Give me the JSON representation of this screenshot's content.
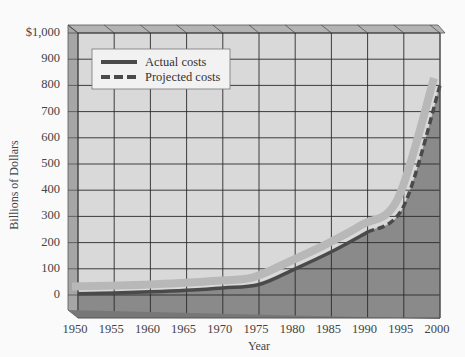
{
  "chart_data": {
    "type": "area",
    "title": "",
    "xlabel": "Year",
    "ylabel": "Billions of Dollars",
    "x": [
      1950,
      1955,
      1960,
      1965,
      1970,
      1975,
      1980,
      1985,
      1990,
      1995,
      2000
    ],
    "xticks": [
      "1950",
      "1955",
      "1960",
      "1965",
      "1970",
      "1975",
      "1980",
      "1985",
      "1990",
      "1995",
      "2000"
    ],
    "yticks": [
      "0",
      "100",
      "200",
      "300",
      "400",
      "500",
      "600",
      "700",
      "800",
      "900",
      "$1,000"
    ],
    "ylim": [
      0,
      1000
    ],
    "grid": true,
    "legend_position": "upper-left",
    "series": [
      {
        "name": "Actual costs",
        "style": "solid",
        "x": [
          1950,
          1955,
          1960,
          1965,
          1970,
          1975,
          1980,
          1985,
          1990
        ],
        "values": [
          5,
          8,
          12,
          18,
          27,
          40,
          100,
          165,
          240
        ]
      },
      {
        "name": "Projected costs",
        "style": "dashed",
        "x": [
          1990,
          1995,
          2000
        ],
        "values": [
          240,
          340,
          800
        ]
      }
    ]
  },
  "legend": {
    "items": [
      {
        "label": "Actual costs",
        "style": "solid"
      },
      {
        "label": "Projected costs",
        "style": "dashed"
      }
    ]
  },
  "axes": {
    "x_title": "Year",
    "y_title": "Billions of Dollars"
  },
  "colors": {
    "background": "#fafafa",
    "plot_face": "#d9d9d9",
    "area_fill": "#8a8a8a",
    "ribbon": "#b8b8b8",
    "line": "#4a4a4a",
    "side_wall": "#a6a6a6",
    "top_wall": "#b3b3b3",
    "grid": "#2a2a2a"
  }
}
